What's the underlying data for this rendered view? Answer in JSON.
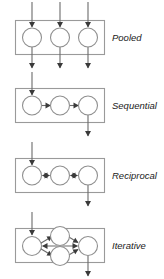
{
  "diagram": {
    "type": "task-interdependence-diagram",
    "background_color": "#ffffff",
    "box_stroke_color": "#9a9a9a",
    "circle_stroke_color": "#8f8f8f",
    "circle_fill_color": "#ffffff",
    "line_color": "#6b6b6b",
    "arrow_color": "#3a3a3a",
    "label_color": "#1a1a1a",
    "panels": [
      {
        "id": "pooled",
        "label": "Pooled",
        "node_count": 3,
        "node_labels": [
          "",
          "",
          ""
        ],
        "inputs": 3,
        "outputs": 3,
        "internal_links": "none",
        "link_direction": "none",
        "description": "Three independent units each with its own vertical input arrow entering from above and output arrow exiting below; no connections between units."
      },
      {
        "id": "sequential",
        "label": "Sequential",
        "node_count": 3,
        "node_labels": [
          "",
          "",
          ""
        ],
        "inputs": 1,
        "outputs": 1,
        "internal_links": "chain",
        "link_direction": "one-way",
        "description": "Single input arrow into the first unit, one-way horizontal arrows chaining unit one to two to three, single output arrow from the last unit."
      },
      {
        "id": "reciprocal",
        "label": "Reciprocal",
        "node_count": 3,
        "node_labels": [
          "",
          "",
          ""
        ],
        "inputs": 1,
        "outputs": 1,
        "internal_links": "chain",
        "link_direction": "two-way",
        "description": "Single input arrow into the first unit, double-headed horizontal arrows between adjacent units, single output arrow from the last unit."
      },
      {
        "id": "iterative",
        "label": "Iterative",
        "node_count": 4,
        "node_labels": [
          "",
          "",
          "",
          ""
        ],
        "inputs": 1,
        "outputs": 1,
        "internal_links": "diamond",
        "link_direction": "two-way",
        "description": "Single input arrow into the left unit, two stacked middle units forming a diamond with diagonal and horizontal double-headed arrows converging on the right unit, single output arrow from the right unit."
      }
    ]
  }
}
